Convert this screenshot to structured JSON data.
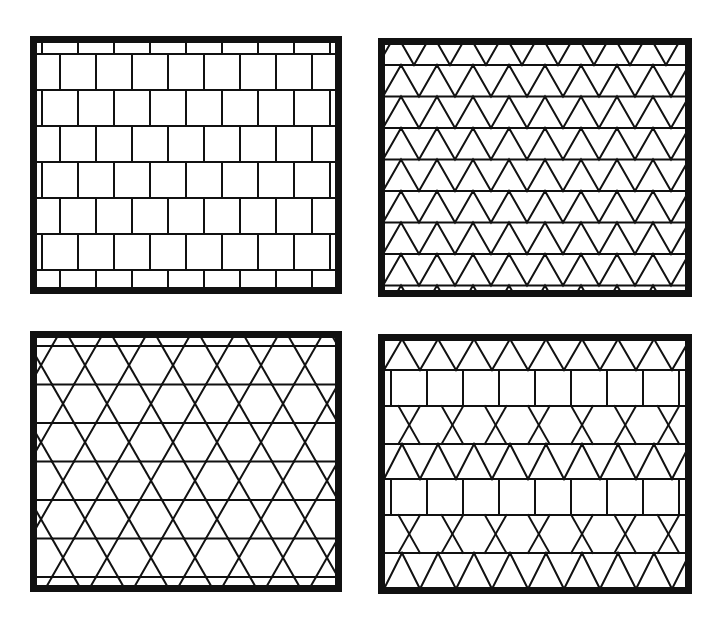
{
  "figure": {
    "stroke_color": "#111111",
    "background_color": "#ffffff",
    "frame_color": "#111111"
  },
  "panels": [
    {
      "id": "top-left",
      "tiling": "square tiling (offset rows, brick-like)",
      "row_height": 36,
      "cell_width": 36,
      "rows_offset": true
    },
    {
      "id": "top-right",
      "tiling": "triangular tiling",
      "row_height": 32,
      "tri_width": 36
    },
    {
      "id": "bottom-left",
      "tiling": "trihexagonal (kagome) tiling",
      "row_height": 39,
      "tri_width": 44
    },
    {
      "id": "bottom-right",
      "tiling": "elongated/mixed triangle-square tiling",
      "row_height": 35,
      "tri_width": 36
    }
  ]
}
